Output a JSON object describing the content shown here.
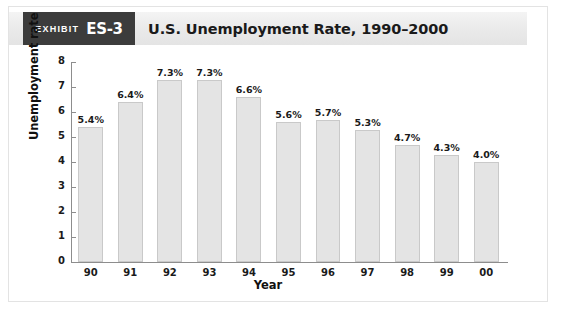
{
  "exhibit": {
    "badge_word": "Exhibit",
    "badge_number": "ES-3",
    "title": "U.S. Unemployment Rate, 1990–2000",
    "badge_bg": "#3c3c3c",
    "band_bg": "#ebebeb"
  },
  "chart_data": {
    "type": "bar",
    "title": "U.S. Unemployment Rate, 1990–2000",
    "xlabel": "Year",
    "ylabel": "Unemployment rate",
    "categories": [
      "90",
      "91",
      "92",
      "93",
      "94",
      "95",
      "96",
      "97",
      "98",
      "99",
      "00"
    ],
    "values": [
      5.4,
      6.4,
      7.3,
      7.3,
      6.6,
      5.6,
      5.7,
      5.3,
      4.7,
      4.3,
      4.0
    ],
    "data_labels": [
      "5.4%",
      "6.4%",
      "7.3%",
      "7.3%",
      "6.6%",
      "5.6%",
      "5.7%",
      "5.3%",
      "4.7%",
      "4.3%",
      "4.0%"
    ],
    "ylim": [
      0,
      8
    ],
    "ytick_labels": [
      "8",
      "7",
      "6",
      "5",
      "4",
      "3",
      "2",
      "1",
      "0"
    ],
    "ytick_values": [
      8,
      7,
      6,
      5,
      4,
      3,
      2,
      1,
      0
    ],
    "grid": false,
    "legend": null,
    "bar_fill": "#e4e4e4",
    "bar_edge": "#c9c9c9",
    "axis_color": "#8d8d8d"
  }
}
